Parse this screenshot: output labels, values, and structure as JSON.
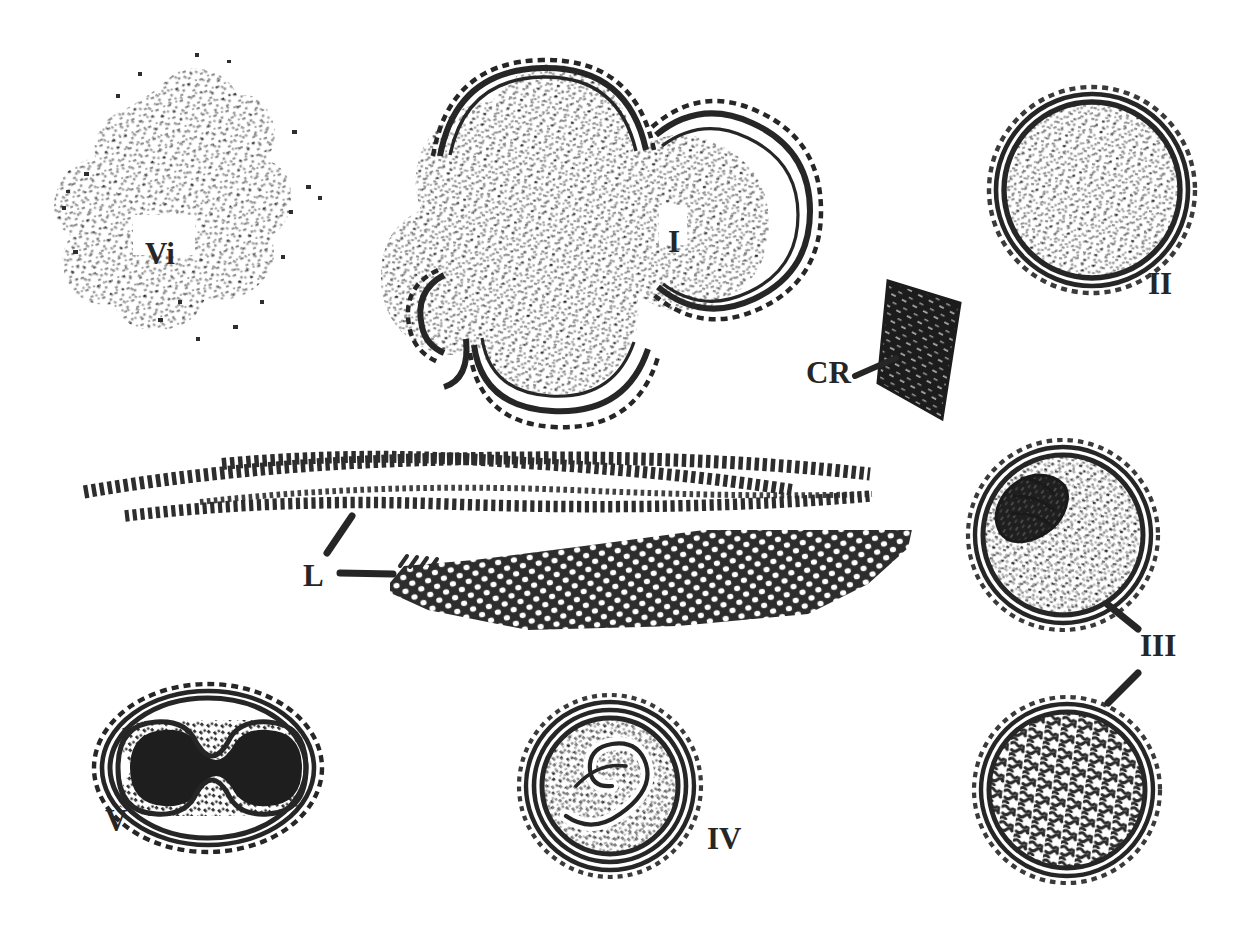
{
  "figure": {
    "kind": "scientific-line-drawing",
    "background_color": "#ffffff",
    "ink_color": "#262626",
    "width": 1239,
    "height": 932
  },
  "labels": [
    {
      "id": "vi",
      "text": "Vi",
      "x": 145,
      "y": 238,
      "font_size": 31,
      "has_leader": false,
      "refers_to": "stippled irregular granular mass, upper left"
    },
    {
      "id": "i",
      "text": "I",
      "x": 668,
      "y": 226,
      "font_size": 31,
      "has_leader": false,
      "refers_to": "multi-lobed budding cell cluster with double wall"
    },
    {
      "id": "ii",
      "text": "II",
      "x": 1148,
      "y": 268,
      "font_size": 31,
      "has_leader": false,
      "refers_to": "spherical double-walled cell with fine stippled contents"
    },
    {
      "id": "cr",
      "text": "CR",
      "x": 806,
      "y": 357,
      "font_size": 31,
      "has_leader": true,
      "refers_to": "dark rhomboid crystal"
    },
    {
      "id": "l",
      "text": "L",
      "x": 303,
      "y": 560,
      "font_size": 31,
      "has_leader": true,
      "refers_to": "elongated beaded filaments / laminated layers"
    },
    {
      "id": "iii",
      "text": "III",
      "x": 1140,
      "y": 630,
      "font_size": 31,
      "has_leader": true,
      "refers_to": "two double-walled cells with internal granular mass"
    },
    {
      "id": "iv",
      "text": "IV",
      "x": 707,
      "y": 823,
      "font_size": 31,
      "has_leader": false,
      "refers_to": "double-walled cell containing coiled hooked larva"
    },
    {
      "id": "v",
      "text": "V",
      "x": 105,
      "y": 805,
      "font_size": 31,
      "has_leader": false,
      "refers_to": "oval multi-layered cyst with dark dumbbell-shaped core"
    }
  ],
  "structures": [
    {
      "id": "vi-granular-mass",
      "name": "stippled-granular-mass",
      "label": "Vi",
      "center_x": 175,
      "center_y": 215,
      "width": 230,
      "height": 290,
      "style": "scattered stipple cloud, no outline"
    },
    {
      "id": "i-budding-cluster",
      "name": "budding-cell-cluster",
      "label": "I",
      "center_x": 585,
      "center_y": 240,
      "width": 330,
      "height": 360,
      "style": "four overlapping lobes, double wall arcs, dense stipple fill"
    },
    {
      "id": "ii-spherical-cell",
      "name": "spherical-walled-cell",
      "label": "II",
      "center_x": 1092,
      "center_y": 190,
      "radius": 96,
      "style": "double circular wall, dotted outer margin, even stipple"
    },
    {
      "id": "cr-crystal",
      "name": "rhomboid-crystal",
      "label": "CR",
      "center_x": 916,
      "center_y": 340,
      "width": 85,
      "height": 125,
      "style": "solid dark quadrilateral with light hatch streaks"
    },
    {
      "id": "l-beaded-filaments",
      "name": "beaded-laminated-filaments",
      "label": "L",
      "x_start": 80,
      "x_end": 872,
      "center_y": 480,
      "count": 3,
      "style": "three overlapping rows of short dash beads"
    },
    {
      "id": "l-mesh-blade",
      "name": "meshed-laminated-blade",
      "label": "L",
      "x_start": 400,
      "x_end": 920,
      "center_y": 590,
      "style": "tapered blade with dense hexagonal reticular dot mesh"
    },
    {
      "id": "iii-upper-cell",
      "name": "cell-with-dark-nucleus",
      "label": "III",
      "center_x": 1063,
      "center_y": 535,
      "radius": 88,
      "style": "double wall, dark crescent nucleus upper-left, stippled cytoplasm"
    },
    {
      "id": "iii-lower-cell",
      "name": "cell-with-convoluted-contents",
      "label": "III",
      "center_x": 1067,
      "center_y": 790,
      "radius": 88,
      "style": "double wall, dense worm-like convoluted fill"
    },
    {
      "id": "iv-larva-cell",
      "name": "cell-with-coiled-larva",
      "label": "IV",
      "center_x": 610,
      "center_y": 786,
      "radius": 84,
      "style": "triple ring wall, coiled hooked larva and granular fill"
    },
    {
      "id": "v-oval-cyst",
      "name": "oval-layered-cyst",
      "label": "V",
      "center_x": 208,
      "center_y": 768,
      "width": 216,
      "height": 166,
      "style": "concentric oval rings with solid dark dumbbell core"
    }
  ]
}
